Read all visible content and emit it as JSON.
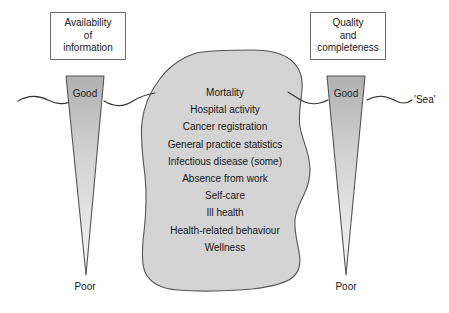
{
  "diagram": {
    "background_color": "#ffffff",
    "width": 449,
    "height": 313
  },
  "left_axis": {
    "box_lines": [
      "Availability",
      "of",
      "information"
    ],
    "top_label": "Good",
    "bottom_label": "Poor"
  },
  "right_axis": {
    "box_lines": [
      "Quality",
      "and",
      "completeness"
    ],
    "top_label": "Good",
    "bottom_label": "Poor"
  },
  "sea": {
    "label": "'Sea'",
    "line_color": "#333333"
  },
  "iceberg": {
    "fill_color": "#d4d4d4",
    "stroke_color": "#555555",
    "items": [
      "Mortality",
      "Hospital activity",
      "Cancer registration",
      "General practice statistics",
      "Infectious disease (some)",
      "Absence from work",
      "Self-care",
      "Ill health",
      "Health-related behaviour",
      "Wellness"
    ]
  },
  "triangles": {
    "gradient_top_color": "#b4b4b4",
    "gradient_bottom_color": "#f2f2f2",
    "stroke_color": "#555555"
  }
}
